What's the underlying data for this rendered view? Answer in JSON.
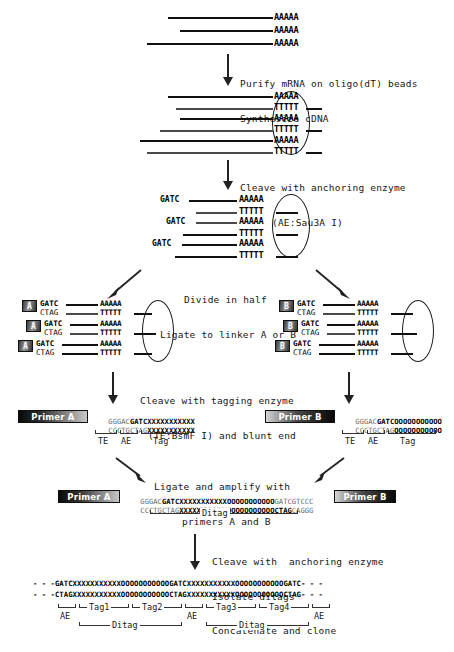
{
  "diagram": {
    "title": "SAGE (Serial Analysis of Gene Expression) method schematic"
  },
  "steps": [
    {
      "id": "step1",
      "line1": "Purify mRNA on oligo(dT) beads",
      "line2": "Synthesize cDNA"
    },
    {
      "id": "step2",
      "line1": "Cleave with anchoring enzyme",
      "line2": "(AE:Sau3A I)"
    },
    {
      "id": "step3",
      "line1": "Divide in half",
      "line2": "Ligate to linker A or B"
    },
    {
      "id": "step4",
      "line1": "Cleave with tagging enzyme",
      "line2": "(TE:BsmF I) and blunt end"
    },
    {
      "id": "step5",
      "line1": "Ligate and amplify with",
      "line2": "primers A and B"
    },
    {
      "id": "step6",
      "line1": "Cleave with  anchoring enzyme",
      "line2": "Isolate ditags",
      "line3": "Concatenate and clone"
    }
  ],
  "panel_mrna": {
    "poly_a": "AAAAA",
    "strands": 3
  },
  "panel_cdna": {
    "top": "AAAAA",
    "bottom": "TTTTT",
    "pairs": 3
  },
  "panel_cleaved": {
    "site": "GATC",
    "top": "AAAAA",
    "bottom": "TTTTT",
    "pairs": 3
  },
  "panel_linker_a": {
    "linker_label": "A",
    "top": "GATC",
    "bottom": "CTAG",
    "top_tail": "AAAAA",
    "bottom_tail": "TTTTT",
    "pairs": 3
  },
  "panel_linker_b": {
    "linker_label": "B",
    "top": "GATC",
    "bottom": "CTAG",
    "top_tail": "AAAAA",
    "bottom_tail": "TTTTT",
    "pairs": 3
  },
  "panel_tag_a": {
    "primer_label": "Primer A",
    "top_prefix": "GGGAC",
    "top_ae": "GATC",
    "top_tag": "XXXXXXXXXXX",
    "bottom_prefix": "CCCTGCTAG",
    "bottom_tag": "XXXXXXXXXXX",
    "brackets": [
      "TE",
      "AE",
      "Tag"
    ]
  },
  "panel_tag_b": {
    "primer_label": "Primer B",
    "top_prefix": "GGGAC",
    "top_ae": "GATC",
    "top_tag": "OOOOOOOOOOO",
    "bottom_prefix": "CCCTGCTAG",
    "bottom_tag": "OOOOOOOOOOO",
    "brackets": [
      "TE",
      "AE",
      "Tag"
    ]
  },
  "panel_ditag": {
    "primer_a_label": "Primer A",
    "primer_b_label": "Primer B",
    "top_prefix": "GGGAC",
    "top_ae": "GATC",
    "top_tagx": "XXXXXXXXXXX",
    "top_tago": "OOOOOOOOOOO",
    "top_suffix": "GATCGTCCC",
    "bottom_prefix": "CCCTGCTAG",
    "bottom_tagx": "XXXXXXXXXXX",
    "bottom_tago": "OOOOOOOOOOO",
    "bottom_ae": "CTAG",
    "bottom_suffix": "CAGGG",
    "bracket_label": "Ditag"
  },
  "panel_concatemer": {
    "top_strand": "- - -GATCXXXXXXXXXXXOOOOOOOOOOOGATCXXXXXXXXXXXOOOOOOOOOOOGATC- - -",
    "bottom_strand": "- - -CTAGXXXXXXXXXXXOOOOOOOOOOOCTAGXXXXXXXXXXXOOOOOOOOOOOCTAG- - -",
    "tag_labels": [
      "Tag1",
      "Tag2",
      "Tag3",
      "Tag4"
    ],
    "ae_labels": [
      "AE",
      "AE",
      "AE"
    ],
    "ditag_labels": [
      "Ditag",
      "Ditag"
    ]
  },
  "colors": {
    "ink": "#111111",
    "grey_strand": "#4a4a4a",
    "light_text": "#6d6d6d",
    "background": "#ffffff"
  }
}
